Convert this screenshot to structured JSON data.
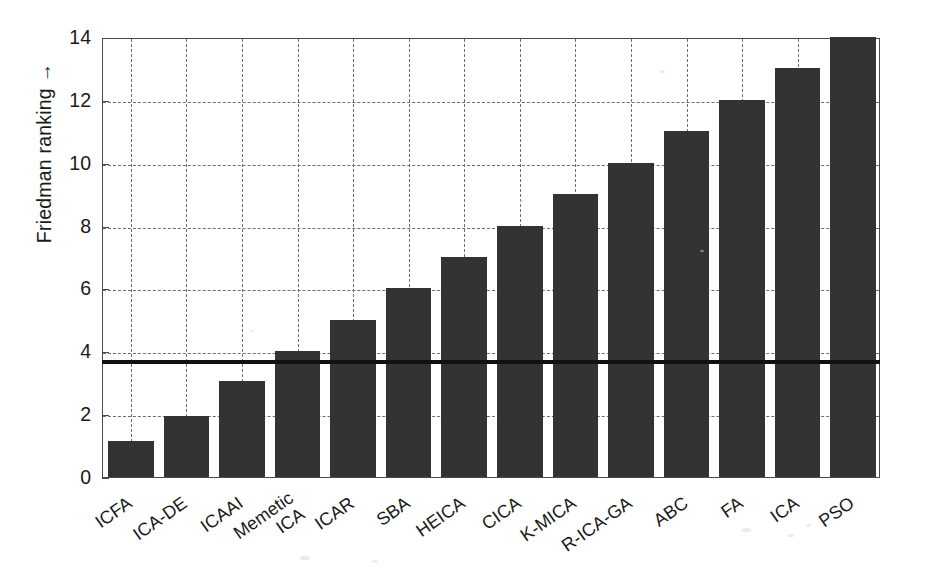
{
  "chart_data": {
    "type": "bar",
    "title": "",
    "xlabel": "",
    "ylabel": "Friedman ranking →",
    "categories": [
      "ICFA",
      "ICA-DE",
      "ICAAI",
      "Memetic ICA",
      "ICAR",
      "SBA",
      "HEICA",
      "CICA",
      "K-MICA",
      "R-ICA-GA",
      "ABC",
      "FA",
      "ICA",
      "PSO"
    ],
    "values": [
      1.15,
      1.95,
      3.05,
      4.0,
      5.0,
      6.0,
      7.0,
      8.0,
      9.0,
      10.0,
      11.0,
      12.0,
      13.0,
      14.0
    ],
    "ylim": [
      0,
      14
    ],
    "yticks": [
      0,
      2,
      4,
      6,
      8,
      10,
      12,
      14
    ],
    "ytick_labels": [
      "0",
      "2",
      "4",
      "6",
      "8",
      "10",
      "12",
      "14"
    ],
    "grid": "dashed both axes",
    "legend": "none",
    "bar_color": "#333333",
    "threshold_line": {
      "label": "",
      "value": 3.8,
      "color": "#111111",
      "style": "solid thick horizontal"
    }
  }
}
